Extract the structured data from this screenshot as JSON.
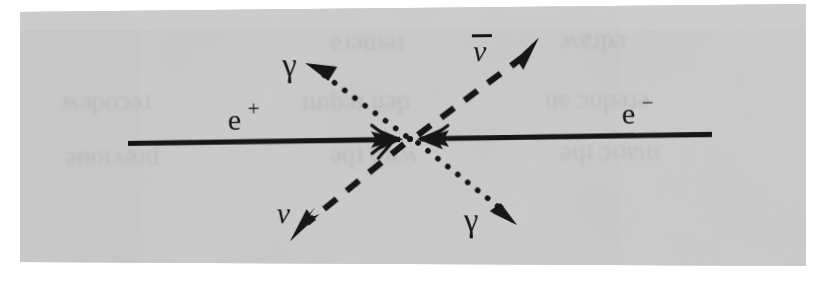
{
  "figure": {
    "name": "electron-positron-annihilation-diagram",
    "kind": "feynman-diagram",
    "caption_text": "",
    "background_color": "#c9c9c9",
    "page_color": "#ffffff",
    "ink_color": "#141414",
    "scan_tilt_degrees": -0.6
  },
  "labels": {
    "positron": "e",
    "positron_charge": "+",
    "electron": "e",
    "electron_charge": "−",
    "photon_upper": "γ",
    "photon_lower": "γ",
    "neutrino": "ν",
    "antineutrino": "ν",
    "antineutrino_bar": "‾"
  },
  "vertex": {
    "x": 410,
    "y": 139,
    "dot_radius": 3
  },
  "lines": [
    {
      "name": "positron-line",
      "particle": "e+",
      "style": "solid",
      "direction": "incoming-from-left",
      "x1": 128,
      "y1": 140,
      "x2": 404,
      "y2": 139,
      "arrow": "solid-triangle-inward",
      "width": 5
    },
    {
      "name": "electron-line",
      "particle": "e-",
      "style": "solid",
      "direction": "incoming-from-right",
      "x1": 712,
      "y1": 138,
      "x2": 416,
      "y2": 139,
      "arrow": "solid-triangle-inward",
      "width": 5
    },
    {
      "name": "photon-upper-left-line",
      "particle": "photon",
      "style": "dotted",
      "direction": "outgoing-upper-left",
      "x1": 404,
      "y1": 135,
      "x2": 316,
      "y2": 69,
      "arrow": "filled-triangle-outward",
      "width": 5
    },
    {
      "name": "photon-lower-right-line",
      "particle": "photon",
      "style": "dotted",
      "direction": "outgoing-lower-right",
      "x1": 416,
      "y1": 143,
      "x2": 502,
      "y2": 213,
      "arrow": "filled-triangle-outward",
      "width": 5
    },
    {
      "name": "antineutrino-line",
      "particle": "antineutrino",
      "style": "dashed",
      "direction": "outgoing-upper-right",
      "x1": 416,
      "y1": 135,
      "x2": 530,
      "y2": 52,
      "arrow": "barbed-outward",
      "width": 6
    },
    {
      "name": "neutrino-line",
      "particle": "neutrino",
      "style": "dashed",
      "direction": "outgoing-lower-left",
      "x1": 404,
      "y1": 143,
      "x2": 300,
      "y2": 228,
      "arrow": "barbed-outward",
      "width": 6
    }
  ],
  "label_positions": {
    "positron": {
      "x": 228,
      "y": 128,
      "size": 30
    },
    "electron": {
      "x": 622,
      "y": 126,
      "size": 30
    },
    "photon_upper": {
      "x": 283,
      "y": 75,
      "size": 32
    },
    "photon_lower": {
      "x": 463,
      "y": 232,
      "size": 32
    },
    "neutrino": {
      "x": 276,
      "y": 222,
      "size": 30
    },
    "antineutrino": {
      "x": 474,
      "y": 60,
      "size": 30
    }
  },
  "ghost_bleed_through": [
    {
      "name": "ghost-line-1",
      "x": 330,
      "y": 50,
      "text": "ɐɹǝɯǝɹ",
      "size": 27
    },
    {
      "name": "ghost-line-2",
      "x": 560,
      "y": 48,
      "text": "ʍɐɹpǝ",
      "size": 27
    },
    {
      "name": "ghost-line-3",
      "x": 60,
      "y": 110,
      "text": "ʍǝpoɔǝɹ",
      "size": 27
    },
    {
      "name": "ghost-line-4",
      "x": 300,
      "y": 110,
      "text": "ɹınbǝɹ uǝp",
      "size": 27
    },
    {
      "name": "ghost-line-5",
      "x": 545,
      "y": 108,
      "text": "uɐ ɔopǝɹǝ",
      "size": 27
    },
    {
      "name": "ghost-line-6",
      "x": 65,
      "y": 165,
      "text": "ǝnoıʌǝɹd",
      "size": 27
    },
    {
      "name": "ghost-line-7",
      "x": 330,
      "y": 163,
      "text": "ǝɥʇ ɥʇıʍ",
      "size": 27
    },
    {
      "name": "ghost-line-8",
      "x": 560,
      "y": 160,
      "text": "ǝɥʇ ɔıʇɐɯ",
      "size": 27
    }
  ]
}
